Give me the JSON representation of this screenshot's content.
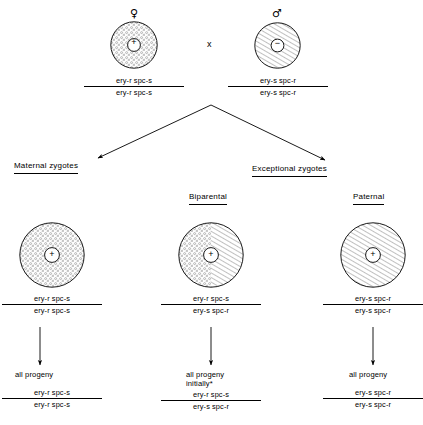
{
  "figure": {
    "cross_symbol": "x",
    "parents": [
      {
        "id": "maternal-parent",
        "sex_symbol": "♀",
        "sex_name": "female",
        "nucleus_sign": "+",
        "fill": "stipple",
        "genotype": {
          "numerator": "ery-r spc-s",
          "denominator": "ery-r spc-s"
        }
      },
      {
        "id": "paternal-parent",
        "sex_symbol": "♂",
        "sex_name": "male",
        "nucleus_sign": "−",
        "fill": "hatch",
        "genotype": {
          "numerator": "ery-s spc-r",
          "denominator": "ery-s spc-r"
        }
      }
    ],
    "branch_labels": {
      "maternal": "Maternal zygotes",
      "exceptional": "Exceptional zygotes"
    },
    "sub_labels": {
      "biparental": "Biparental",
      "paternal": "Paternal"
    },
    "zygotes": [
      {
        "id": "maternal-zygote",
        "fill": "stipple",
        "nucleus_sign": "+",
        "genotype": {
          "numerator": "ery-r spc-s",
          "denominator": "ery-r spc-s"
        },
        "progeny_caption": "all progeny",
        "progeny_caption_line2": "",
        "progeny_genotype": {
          "numerator": "ery-r spc-s",
          "denominator": "ery-r spc-s"
        }
      },
      {
        "id": "biparental-zygote",
        "fill": "half-stipple-half-hatch",
        "nucleus_sign": "+",
        "genotype": {
          "numerator": "ery-r spc-s",
          "denominator": "ery-s spc-r"
        },
        "progeny_caption": "all progeny",
        "progeny_caption_line2": "initially*",
        "progeny_genotype": {
          "numerator": "ery-r spc-s",
          "denominator": "ery-s spc-r"
        }
      },
      {
        "id": "paternal-zygote",
        "fill": "hatch",
        "nucleus_sign": "+",
        "genotype": {
          "numerator": "ery-s spc-r",
          "denominator": "ery-s spc-r"
        },
        "progeny_caption": "all progeny",
        "progeny_caption_line2": "",
        "progeny_genotype": {
          "numerator": "ery-s spc-r",
          "denominator": "ery-s spc-r"
        }
      }
    ],
    "colors": {
      "ink": "#000000",
      "background": "#ffffff",
      "stipple": "#9a9a9a",
      "hatch": "#8c8c8c"
    }
  }
}
